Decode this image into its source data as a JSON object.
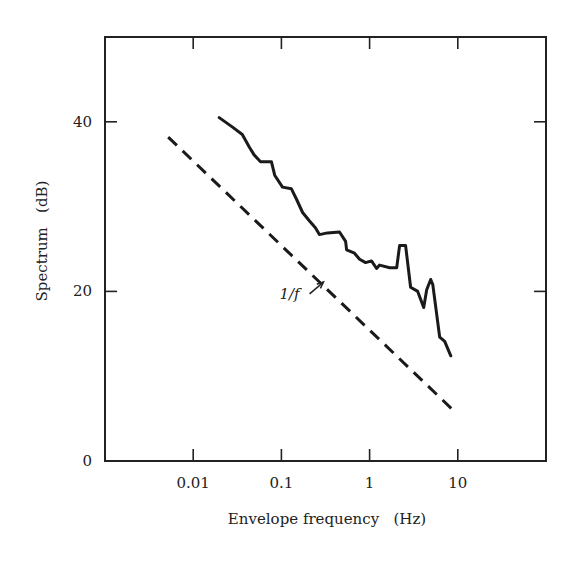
{
  "chart_data": {
    "type": "line",
    "title": "",
    "xlabel": "Envelope frequency   (Hz)",
    "ylabel": "Spectrum   (dB)",
    "xscale": "log",
    "xlim": [
      0.001,
      100
    ],
    "ylim": [
      0,
      50
    ],
    "x_ticks": [
      0.01,
      0.1,
      1,
      10
    ],
    "x_tick_labels": [
      "0.01",
      "0.1",
      "1",
      "10"
    ],
    "y_ticks": [
      0,
      20,
      40
    ],
    "y_tick_labels": [
      "0",
      "20",
      "40"
    ],
    "grid": false,
    "legend": null,
    "series": [
      {
        "name": "measured spectrum",
        "style": "solid",
        "x": [
          0.0197,
          0.0277,
          0.036,
          0.0434,
          0.049,
          0.058,
          0.077,
          0.084,
          0.103,
          0.13,
          0.148,
          0.174,
          0.208,
          0.243,
          0.27,
          0.333,
          0.456,
          0.534,
          0.548,
          0.675,
          0.77,
          0.9,
          1.05,
          1.2,
          1.3,
          1.69,
          2.03,
          2.19,
          2.56,
          2.92,
          3.51,
          4.11,
          4.44,
          4.93,
          5.2,
          6.24,
          7.1,
          8.33
        ],
        "y": [
          40.5,
          39.4,
          38.5,
          37.0,
          36.1,
          35.3,
          35.3,
          33.7,
          32.3,
          32.1,
          30.9,
          29.3,
          28.3,
          27.5,
          26.7,
          26.9,
          27.0,
          25.9,
          24.9,
          24.5,
          23.8,
          23.4,
          23.6,
          22.7,
          23.1,
          22.8,
          22.8,
          25.4,
          25.4,
          20.5,
          20.0,
          18.1,
          20.2,
          21.4,
          20.8,
          14.6,
          14.1,
          12.4
        ]
      },
      {
        "name": "1/f",
        "style": "dashed",
        "x": [
          0.0052,
          9.5
        ],
        "y": [
          38.2,
          5.7
        ]
      }
    ],
    "annotations": [
      {
        "text": "1/f",
        "x": 0.22,
        "y": 19.7,
        "arrow_to": [
          0.3,
          21.1
        ]
      }
    ]
  }
}
